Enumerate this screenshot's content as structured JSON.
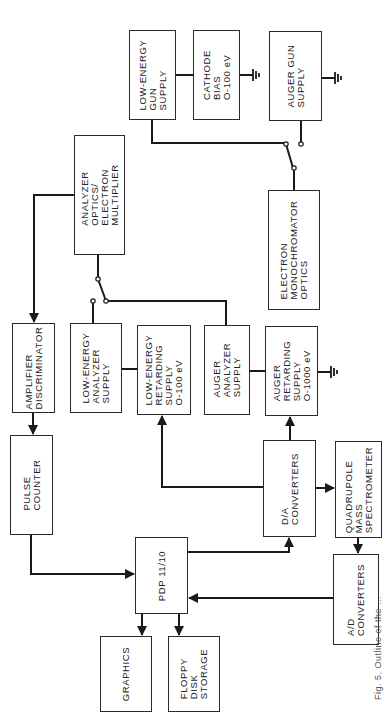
{
  "figure": {
    "caption": "Fig. 5. Outline of the ...",
    "orientation": "rotated -90deg (landscape figure on portrait page)"
  },
  "blocks": {
    "low_energy_gun_supply": {
      "label": "LOW-ENERGY\nGUN\nSUPPLY"
    },
    "cathode_bias": {
      "label": "CATHODE\nBIAS\nO-100 eV"
    },
    "auger_gun_supply": {
      "label": "AUGER GUN\nSUPPLY"
    },
    "analyzer_optics": {
      "label": "ANALYZER\nOPTICS/\nELECTRON\nMULTIPLIER"
    },
    "electron_monochromator": {
      "label": "ELECTRON\nMONOCHROMATOR\nOPTICS"
    },
    "amplifier_discriminator": {
      "label": "AMPLIFIER\nDISCRIMINATOR"
    },
    "low_energy_analyzer_supply": {
      "label": "LOW-ENERGY\nANALYZER\nSUPPLY"
    },
    "low_energy_retarding_supply": {
      "label": "LOW-ENERGY\nRETARDING\nSUPPLY\nO-100 eV"
    },
    "auger_analyzer_supply": {
      "label": "AUGER\nANALYZER\nSUPPLY"
    },
    "auger_retarding_supply": {
      "label": "AUGER\nRETARDING\nSUPPLY\nO-1000 eV"
    },
    "pulse_counter": {
      "label": "PULSE\nCOUNTER"
    },
    "da_converters": {
      "label": "D/A\nCONVERTERS"
    },
    "quadrupole_mass_spectrometer": {
      "label": "QUADRUPOLE\nMASS\nSPECTROMETER"
    },
    "pdp_11_10": {
      "label": "PDP 11/10"
    },
    "ad_converters": {
      "label": "A/D\nCONVERTERS"
    },
    "graphics": {
      "label": "GRAPHICS"
    },
    "floppy_disk_storage": {
      "label": "FLOPPY\nDISK\nSTORAGE"
    }
  },
  "connections": [
    {
      "from": "analyzer_optics",
      "to": "amplifier_discriminator",
      "arrow": true
    },
    {
      "from": "amplifier_discriminator",
      "to": "pulse_counter",
      "arrow": true
    },
    {
      "from": "pulse_counter",
      "to": "pdp_11_10",
      "arrow": true
    },
    {
      "from": "pdp_11_10",
      "to": "graphics",
      "arrow": true
    },
    {
      "from": "pdp_11_10",
      "to": "floppy_disk_storage",
      "arrow": true
    },
    {
      "from": "pdp_11_10",
      "to": "da_converters",
      "arrow": true
    },
    {
      "from": "ad_converters",
      "to": "pdp_11_10",
      "arrow": true
    },
    {
      "from": "da_converters",
      "to": "low_energy_retarding_supply",
      "arrow": true
    },
    {
      "from": "da_converters",
      "to": "auger_retarding_supply",
      "arrow": true
    },
    {
      "from": "da_converters",
      "to": "quadrupole_mass_spectrometer",
      "arrow": true
    },
    {
      "from": "quadrupole_mass_spectrometer",
      "to": "ad_converters",
      "arrow": true
    },
    {
      "from": "low_energy_analyzer_supply",
      "to": "low_energy_retarding_supply",
      "arrow": false
    },
    {
      "from": "auger_analyzer_supply",
      "to": "auger_retarding_supply",
      "arrow": false
    },
    {
      "from": "low_energy_gun_supply",
      "to": "cathode_bias",
      "arrow": false
    },
    {
      "from": "analyzer_optics",
      "to": "switch(low_energy_analyzer_supply | auger_analyzer_supply)",
      "arrow": false
    },
    {
      "from": "electron_monochromator",
      "to": "switch(low_energy_gun_supply | auger_gun_supply)",
      "arrow": false
    }
  ],
  "grounds": [
    "cathode_bias",
    "auger_gun_supply",
    "auger_retarding_supply"
  ]
}
